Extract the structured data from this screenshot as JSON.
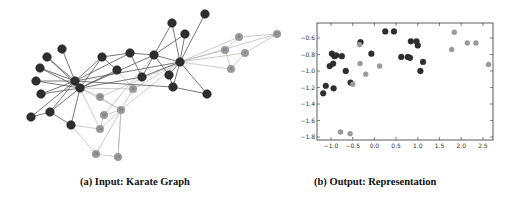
{
  "figure": {
    "captions": {
      "a": "(a) Input: Karate Graph",
      "b": "(b) Output: Representation"
    },
    "colors": {
      "dark_node": "#2e2e2e",
      "light_node": "#9a9a9a",
      "dark_edge": "#555555",
      "light_edge": "#b5b5b5",
      "axis": "#333333"
    }
  },
  "graph": {
    "nodes": [
      {
        "id": "d1",
        "x": 205,
        "y": 14,
        "group": "dark"
      },
      {
        "id": "d2",
        "x": 172,
        "y": 23,
        "group": "dark"
      },
      {
        "id": "d3",
        "x": 185,
        "y": 34,
        "group": "dark"
      },
      {
        "id": "d4",
        "x": 62,
        "y": 49,
        "group": "dark"
      },
      {
        "id": "d5",
        "x": 47,
        "y": 57,
        "group": "dark"
      },
      {
        "id": "d6",
        "x": 40,
        "y": 68,
        "group": "dark"
      },
      {
        "id": "d7",
        "x": 36,
        "y": 81,
        "group": "dark"
      },
      {
        "id": "d8",
        "x": 41,
        "y": 94,
        "group": "dark"
      },
      {
        "id": "d9",
        "x": 75,
        "y": 81,
        "group": "dark"
      },
      {
        "id": "d10",
        "x": 80,
        "y": 88,
        "group": "dark"
      },
      {
        "id": "d11",
        "x": 102,
        "y": 57,
        "group": "dark"
      },
      {
        "id": "d12",
        "x": 130,
        "y": 53,
        "group": "dark"
      },
      {
        "id": "d13",
        "x": 154,
        "y": 55,
        "group": "dark"
      },
      {
        "id": "d14",
        "x": 180,
        "y": 62,
        "group": "dark"
      },
      {
        "id": "d15",
        "x": 117,
        "y": 70,
        "group": "dark"
      },
      {
        "id": "d16",
        "x": 142,
        "y": 77,
        "group": "dark"
      },
      {
        "id": "d17",
        "x": 169,
        "y": 75,
        "group": "dark"
      },
      {
        "id": "d18",
        "x": 173,
        "y": 87,
        "group": "dark"
      },
      {
        "id": "d19",
        "x": 207,
        "y": 94,
        "group": "dark"
      },
      {
        "id": "d20",
        "x": 50,
        "y": 112,
        "group": "dark"
      },
      {
        "id": "d21",
        "x": 31,
        "y": 117,
        "group": "dark"
      },
      {
        "id": "d22",
        "x": 71,
        "y": 125,
        "group": "dark"
      },
      {
        "id": "l1",
        "x": 133,
        "y": 89,
        "group": "light",
        "label": "9"
      },
      {
        "id": "l2",
        "x": 100,
        "y": 97,
        "group": "light",
        "label": "30"
      },
      {
        "id": "l3",
        "x": 121,
        "y": 110,
        "group": "light",
        "label": "33"
      },
      {
        "id": "l4",
        "x": 104,
        "y": 115,
        "group": "light",
        "label": "26"
      },
      {
        "id": "l5",
        "x": 100,
        "y": 129,
        "group": "light",
        "label": "28"
      },
      {
        "id": "l6",
        "x": 96,
        "y": 154,
        "group": "light",
        "label": "26"
      },
      {
        "id": "l7",
        "x": 118,
        "y": 157,
        "group": "light",
        "label": "25"
      },
      {
        "id": "l8",
        "x": 239,
        "y": 37,
        "group": "light",
        "label": "6"
      },
      {
        "id": "l9",
        "x": 225,
        "y": 50,
        "group": "light",
        "label": "11"
      },
      {
        "id": "l10",
        "x": 245,
        "y": 53,
        "group": "light",
        "label": "7"
      },
      {
        "id": "l11",
        "x": 231,
        "y": 69,
        "group": "light",
        "label": "5"
      },
      {
        "id": "l12",
        "x": 277,
        "y": 34,
        "group": "light",
        "label": "17"
      }
    ],
    "edges": [
      [
        "d4",
        "d9"
      ],
      [
        "d5",
        "d9"
      ],
      [
        "d6",
        "d9"
      ],
      [
        "d7",
        "d9"
      ],
      [
        "d8",
        "d9"
      ],
      [
        "d9",
        "d10"
      ],
      [
        "d6",
        "d10"
      ],
      [
        "d7",
        "d10"
      ],
      [
        "d8",
        "d10"
      ],
      [
        "d5",
        "d10"
      ],
      [
        "d9",
        "d11"
      ],
      [
        "d9",
        "d12"
      ],
      [
        "d9",
        "d14"
      ],
      [
        "d10",
        "d11"
      ],
      [
        "d10",
        "d15"
      ],
      [
        "d10",
        "d13"
      ],
      [
        "d9",
        "d20"
      ],
      [
        "d9",
        "d21"
      ],
      [
        "d10",
        "d22"
      ],
      [
        "d20",
        "d21"
      ],
      [
        "d20",
        "d22"
      ],
      [
        "d10",
        "d20"
      ],
      [
        "d11",
        "d12"
      ],
      [
        "d12",
        "d13"
      ],
      [
        "d13",
        "d14"
      ],
      [
        "d11",
        "d15"
      ],
      [
        "d13",
        "d16"
      ],
      [
        "d13",
        "d17"
      ],
      [
        "d14",
        "d2"
      ],
      [
        "d14",
        "d3"
      ],
      [
        "d14",
        "d1"
      ],
      [
        "d2",
        "d13"
      ],
      [
        "d3",
        "d13"
      ],
      [
        "d14",
        "d17"
      ],
      [
        "d14",
        "d18"
      ],
      [
        "d14",
        "d19"
      ],
      [
        "d14",
        "d16"
      ],
      [
        "d18",
        "d19"
      ],
      [
        "d17",
        "d18"
      ],
      [
        "d9",
        "d18"
      ],
      [
        "d10",
        "d16"
      ],
      [
        "d16",
        "d12"
      ]
    ],
    "light_edges": [
      [
        "l1",
        "d14"
      ],
      [
        "l1",
        "d10"
      ],
      [
        "l1",
        "d15"
      ],
      [
        "l2",
        "d10"
      ],
      [
        "l2",
        "l3"
      ],
      [
        "l2",
        "d14"
      ],
      [
        "l3",
        "d14"
      ],
      [
        "l3",
        "d10"
      ],
      [
        "l3",
        "l4"
      ],
      [
        "l3",
        "l7"
      ],
      [
        "l4",
        "d13"
      ],
      [
        "l5",
        "d22"
      ],
      [
        "l5",
        "d10"
      ],
      [
        "l5",
        "l3"
      ],
      [
        "l6",
        "d22"
      ],
      [
        "l6",
        "l7"
      ],
      [
        "l6",
        "l1"
      ],
      [
        "l7",
        "l3"
      ],
      [
        "l8",
        "d14"
      ],
      [
        "l9",
        "d14"
      ],
      [
        "l10",
        "d14"
      ],
      [
        "l11",
        "d14"
      ],
      [
        "l8",
        "l9"
      ],
      [
        "l8",
        "l12"
      ],
      [
        "l10",
        "l11"
      ],
      [
        "l9",
        "l11"
      ],
      [
        "l10",
        "l12"
      ],
      [
        "l12",
        "d14"
      ],
      [
        "l4",
        "l5"
      ]
    ]
  },
  "chart_data": {
    "type": "scatter",
    "title": "",
    "xlabel": "",
    "ylabel": "",
    "xlim": [
      -1.2,
      2.7
    ],
    "ylim": [
      -1.85,
      -0.42
    ],
    "x_ticks": [
      -1.0,
      -0.5,
      0.0,
      0.5,
      1.0,
      1.5,
      2.0,
      2.5
    ],
    "x_tick_labels": [
      "−1.0",
      "−0.5",
      "0.0",
      "0.5",
      "1.0",
      "1.5",
      "2.0",
      "2.5"
    ],
    "y_ticks": [
      -0.6,
      -0.8,
      -1.0,
      -1.2,
      -1.4,
      -1.6,
      -1.8
    ],
    "y_tick_labels": [
      "−0.6",
      "−0.8",
      "−1.0",
      "−1.2",
      "−1.4",
      "−1.6",
      "−1.8"
    ],
    "grid": false,
    "legend": null,
    "series": [
      {
        "name": "dark cluster",
        "color": "#2e2e2e",
        "points": [
          [
            -1.18,
            -1.27
          ],
          [
            -1.12,
            -1.18
          ],
          [
            -1.03,
            -0.94
          ],
          [
            -0.98,
            -0.79
          ],
          [
            -0.95,
            -0.91
          ],
          [
            -0.94,
            -1.21
          ],
          [
            -0.92,
            -0.82
          ],
          [
            -0.88,
            -0.81
          ],
          [
            -0.75,
            -0.82
          ],
          [
            -0.66,
            -1.0
          ],
          [
            -0.55,
            -1.14
          ],
          [
            -0.32,
            -0.65
          ],
          [
            -0.07,
            -0.79
          ],
          [
            0.25,
            -0.52
          ],
          [
            0.45,
            -0.52
          ],
          [
            0.62,
            -0.83
          ],
          [
            0.77,
            -0.83
          ],
          [
            0.82,
            -0.84
          ],
          [
            0.84,
            -0.64
          ],
          [
            0.97,
            -0.64
          ],
          [
            1.0,
            -0.69
          ],
          [
            1.06,
            -1.0
          ],
          [
            1.12,
            -0.89
          ]
        ]
      },
      {
        "name": "light cluster",
        "color": "#9a9a9a",
        "points": [
          [
            -0.78,
            -1.74
          ],
          [
            -0.56,
            -1.76
          ],
          [
            -0.5,
            -1.16
          ],
          [
            -0.34,
            -0.68
          ],
          [
            -0.33,
            -0.91
          ],
          [
            -0.2,
            -1.04
          ],
          [
            0.12,
            -0.94
          ],
          [
            1.78,
            -0.74
          ],
          [
            1.84,
            -0.53
          ],
          [
            2.14,
            -0.66
          ],
          [
            2.34,
            -0.66
          ],
          [
            2.63,
            -0.92
          ]
        ]
      }
    ]
  }
}
